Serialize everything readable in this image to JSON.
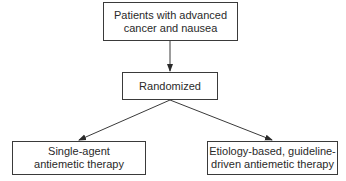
{
  "nodes": {
    "top": {
      "lines": [
        "Patients with advanced",
        "cancer and nausea"
      ]
    },
    "middle": {
      "lines": [
        "Randomized"
      ]
    },
    "left": {
      "lines": [
        "Single-agent",
        "antiemetic therapy"
      ]
    },
    "right": {
      "lines": [
        "Etiology-based, guideline-",
        "driven antiemetic therapy"
      ]
    }
  },
  "edges": [
    {
      "from": "top",
      "to": "middle"
    },
    {
      "from": "middle",
      "to": "left"
    },
    {
      "from": "middle",
      "to": "right"
    }
  ],
  "colors": {
    "line": "#3a3a3a",
    "text": "#2a2a2a",
    "background": "#ffffff"
  }
}
